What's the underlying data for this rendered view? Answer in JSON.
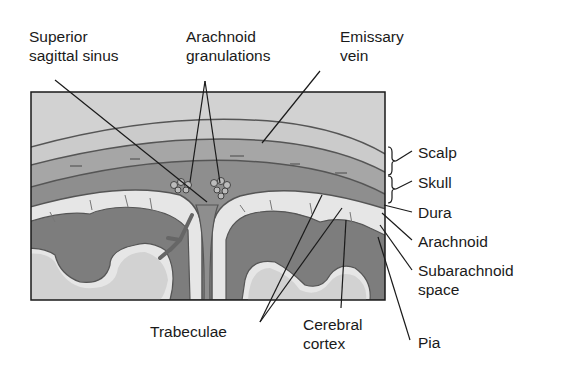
{
  "figure": {
    "colors": {
      "background": "#ffffff",
      "frame": "#1a1a1a",
      "scalp": "#cfcfcf",
      "skull": "#a9a9a9",
      "dura": "#8c8c8c",
      "subarachnoid": "#e6e6e6",
      "cortex": "#7d7d7d",
      "white_matter": "#d2d2d2",
      "leader_line": "#1a1a1a",
      "text": "#1a1a1a"
    }
  },
  "labels": {
    "superior_sagittal_sinus": {
      "line1": "Superior",
      "line2": "sagittal sinus"
    },
    "arachnoid_granulations": {
      "line1": "Arachnoid",
      "line2": "granulations"
    },
    "emissary_vein": {
      "line1": "Emissary",
      "line2": "vein"
    },
    "scalp": "Scalp",
    "skull": "Skull",
    "dura": "Dura",
    "arachnoid": "Arachnoid",
    "subarachnoid_space": {
      "line1": "Subarachnoid",
      "line2": "space"
    },
    "pia": "Pia",
    "cerebral_cortex": {
      "line1": "Cerebral",
      "line2": "cortex"
    },
    "trabeculae": "Trabeculae"
  }
}
